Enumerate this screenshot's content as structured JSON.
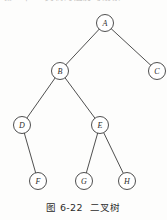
{
  "page": {
    "background_color": "#fdfdfc",
    "ink_color": "#3b3b3b",
    "cropped_header_text": "第一节  二叉树的遍历与线索"
  },
  "caption": {
    "figure_number": "图 6-22",
    "figure_title": "二叉树",
    "full_text": "图 6-22　二叉树"
  },
  "diagram": {
    "type": "binary-tree",
    "node_radius": 8.5,
    "nodes": [
      {
        "id": "A",
        "label": "A",
        "x": 105,
        "y": 23
      },
      {
        "id": "B",
        "label": "B",
        "x": 60,
        "y": 71
      },
      {
        "id": "C",
        "label": "C",
        "x": 157,
        "y": 71
      },
      {
        "id": "D",
        "label": "D",
        "x": 22,
        "y": 125
      },
      {
        "id": "E",
        "label": "E",
        "x": 100,
        "y": 125
      },
      {
        "id": "F",
        "label": "F",
        "x": 38,
        "y": 181
      },
      {
        "id": "G",
        "label": "G",
        "x": 84,
        "y": 181
      },
      {
        "id": "H",
        "label": "H",
        "x": 127,
        "y": 181
      }
    ],
    "edges": [
      {
        "from": "A",
        "to": "B",
        "side": "left"
      },
      {
        "from": "A",
        "to": "C",
        "side": "right"
      },
      {
        "from": "B",
        "to": "D",
        "side": "left"
      },
      {
        "from": "B",
        "to": "E",
        "side": "right"
      },
      {
        "from": "D",
        "to": "F",
        "side": "right"
      },
      {
        "from": "E",
        "to": "G",
        "side": "left"
      },
      {
        "from": "E",
        "to": "H",
        "side": "right"
      }
    ]
  }
}
